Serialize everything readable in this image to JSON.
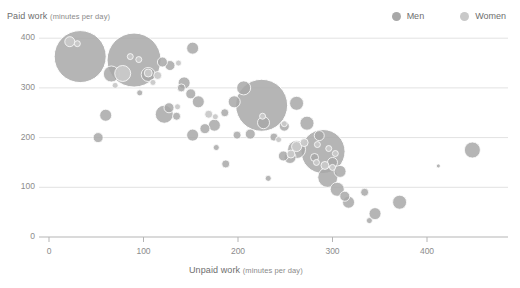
{
  "chart_data": {
    "type": "scatter",
    "title": "",
    "xlabel": "Unpaid work",
    "xlabel_unit": "(minutes per day)",
    "ylabel": "Paid work",
    "ylabel_unit": "(minutes per day)",
    "xlim": [
      0,
      470
    ],
    "ylim": [
      0,
      420
    ],
    "xticks": [
      0,
      100,
      200,
      300,
      400
    ],
    "yticks": [
      0,
      100,
      200,
      300,
      400
    ],
    "grid": "horizontal",
    "legend_position": "top-right",
    "bubble_note": "bubble area encodes population size",
    "series": [
      {
        "name": "Men",
        "color": "#a8a8a8",
        "points": [
          {
            "x": 33,
            "y": 363,
            "r": 26
          },
          {
            "x": 90,
            "y": 356,
            "r": 27
          },
          {
            "x": 225,
            "y": 265,
            "r": 26
          },
          {
            "x": 290,
            "y": 172,
            "r": 22
          },
          {
            "x": 152,
            "y": 380,
            "r": 6
          },
          {
            "x": 128,
            "y": 345,
            "r": 5
          },
          {
            "x": 120,
            "y": 352,
            "r": 5
          },
          {
            "x": 105,
            "y": 327,
            "r": 7
          },
          {
            "x": 66,
            "y": 328,
            "r": 8
          },
          {
            "x": 143,
            "y": 310,
            "r": 6
          },
          {
            "x": 140,
            "y": 300,
            "r": 4
          },
          {
            "x": 150,
            "y": 288,
            "r": 5
          },
          {
            "x": 158,
            "y": 272,
            "r": 6
          },
          {
            "x": 60,
            "y": 245,
            "r": 6
          },
          {
            "x": 127,
            "y": 260,
            "r": 5
          },
          {
            "x": 122,
            "y": 247,
            "r": 9
          },
          {
            "x": 135,
            "y": 243,
            "r": 4
          },
          {
            "x": 196,
            "y": 272,
            "r": 6
          },
          {
            "x": 186,
            "y": 250,
            "r": 4
          },
          {
            "x": 206,
            "y": 300,
            "r": 7
          },
          {
            "x": 175,
            "y": 225,
            "r": 6
          },
          {
            "x": 165,
            "y": 218,
            "r": 5
          },
          {
            "x": 152,
            "y": 205,
            "r": 6
          },
          {
            "x": 52,
            "y": 200,
            "r": 5
          },
          {
            "x": 199,
            "y": 205,
            "r": 4
          },
          {
            "x": 213,
            "y": 207,
            "r": 5
          },
          {
            "x": 227,
            "y": 230,
            "r": 6
          },
          {
            "x": 238,
            "y": 201,
            "r": 4
          },
          {
            "x": 249,
            "y": 223,
            "r": 5
          },
          {
            "x": 262,
            "y": 269,
            "r": 7
          },
          {
            "x": 273,
            "y": 229,
            "r": 7
          },
          {
            "x": 286,
            "y": 204,
            "r": 5
          },
          {
            "x": 262,
            "y": 176,
            "r": 9
          },
          {
            "x": 255,
            "y": 160,
            "r": 6
          },
          {
            "x": 248,
            "y": 163,
            "r": 5
          },
          {
            "x": 281,
            "y": 160,
            "r": 4
          },
          {
            "x": 300,
            "y": 150,
            "r": 5
          },
          {
            "x": 308,
            "y": 132,
            "r": 6
          },
          {
            "x": 295,
            "y": 120,
            "r": 10
          },
          {
            "x": 305,
            "y": 96,
            "r": 7
          },
          {
            "x": 313,
            "y": 82,
            "r": 5
          },
          {
            "x": 317,
            "y": 70,
            "r": 6
          },
          {
            "x": 334,
            "y": 90,
            "r": 4
          },
          {
            "x": 345,
            "y": 47,
            "r": 6
          },
          {
            "x": 371,
            "y": 70,
            "r": 7
          },
          {
            "x": 448,
            "y": 175,
            "r": 8
          },
          {
            "x": 187,
            "y": 147,
            "r": 4
          },
          {
            "x": 232,
            "y": 118,
            "r": 3
          },
          {
            "x": 339,
            "y": 33,
            "r": 3
          },
          {
            "x": 412,
            "y": 143,
            "r": 2
          },
          {
            "x": 177,
            "y": 180,
            "r": 3
          },
          {
            "x": 96,
            "y": 290,
            "r": 3
          }
        ]
      },
      {
        "name": "Women",
        "color": "#c9c9c9",
        "points": [
          {
            "x": 22,
            "y": 393,
            "r": 5
          },
          {
            "x": 30,
            "y": 389,
            "r": 3
          },
          {
            "x": 86,
            "y": 363,
            "r": 3
          },
          {
            "x": 95,
            "y": 357,
            "r": 3
          },
          {
            "x": 78,
            "y": 329,
            "r": 8
          },
          {
            "x": 105,
            "y": 330,
            "r": 4
          },
          {
            "x": 115,
            "y": 325,
            "r": 4
          },
          {
            "x": 70,
            "y": 305,
            "r": 3
          },
          {
            "x": 137,
            "y": 350,
            "r": 3
          },
          {
            "x": 110,
            "y": 311,
            "r": 3
          },
          {
            "x": 226,
            "y": 243,
            "r": 3
          },
          {
            "x": 249,
            "y": 228,
            "r": 3
          },
          {
            "x": 169,
            "y": 247,
            "r": 4
          },
          {
            "x": 176,
            "y": 242,
            "r": 3
          },
          {
            "x": 262,
            "y": 182,
            "r": 5
          },
          {
            "x": 270,
            "y": 190,
            "r": 4
          },
          {
            "x": 256,
            "y": 167,
            "r": 4
          },
          {
            "x": 284,
            "y": 186,
            "r": 3
          },
          {
            "x": 296,
            "y": 178,
            "r": 3
          },
          {
            "x": 303,
            "y": 168,
            "r": 3
          },
          {
            "x": 292,
            "y": 144,
            "r": 4
          },
          {
            "x": 300,
            "y": 140,
            "r": 3
          },
          {
            "x": 283,
            "y": 150,
            "r": 3
          },
          {
            "x": 243,
            "y": 196,
            "r": 3
          },
          {
            "x": 136,
            "y": 262,
            "r": 3
          }
        ]
      }
    ]
  },
  "legend": {
    "items": [
      {
        "label": "Men",
        "color": "#a8a8a8"
      },
      {
        "label": "Women",
        "color": "#c9c9c9"
      }
    ]
  },
  "axes": {
    "y_title_main": "Paid work",
    "y_title_unit": "(minutes per day)",
    "x_title_main": "Unpaid work",
    "x_title_unit": "(minutes per day)",
    "y_tick_labels": [
      "0",
      "100",
      "200",
      "300",
      "400"
    ],
    "x_tick_labels": [
      "0",
      "100",
      "200",
      "300",
      "400"
    ]
  },
  "colors": {
    "men": "#a8a8a8",
    "women": "#c9c9c9",
    "grid": "#e2e2e2",
    "axis": "#b5b5b5",
    "text": "#7a7a7a",
    "background": "#ffffff"
  }
}
